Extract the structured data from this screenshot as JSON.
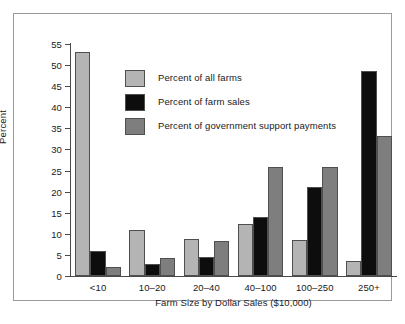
{
  "chart_data": {
    "type": "bar",
    "title": "",
    "xlabel": "Farm Size by Dollar Sales ($10,000)",
    "ylabel": "Percent",
    "categories": [
      "<10",
      "10–20",
      "20–40",
      "40–100",
      "100–250",
      "250+"
    ],
    "ylim": [
      0,
      55
    ],
    "yticks": [
      0,
      5,
      10,
      15,
      20,
      25,
      30,
      35,
      40,
      45,
      50,
      55
    ],
    "ytick_labels": [
      "0",
      "5",
      "10",
      "15",
      "20",
      "25",
      "30",
      "35",
      "40",
      "45",
      "50",
      "55"
    ],
    "grid": false,
    "legend_position": "inside-upper-left",
    "series": [
      {
        "name": "Percent of all farms",
        "color": "#b4b4b4",
        "values": [
          53.0,
          10.8,
          8.8,
          12.3,
          8.6,
          3.6
        ]
      },
      {
        "name": "Percent of farm sales",
        "color": "#0d0d0d",
        "values": [
          5.9,
          2.9,
          4.4,
          14.0,
          21.1,
          48.6
        ]
      },
      {
        "name": "Percent of government support payments",
        "color": "#7e7e7e",
        "values": [
          2.2,
          4.2,
          8.2,
          25.8,
          25.9,
          33.3
        ]
      }
    ]
  },
  "figure": {
    "background": "#ffffff",
    "border_color": "#9a9a9a",
    "axis_color": "#4a4a4a",
    "bar_outline_color": "#4f4f4f",
    "text_color": "#1a1a1a"
  }
}
